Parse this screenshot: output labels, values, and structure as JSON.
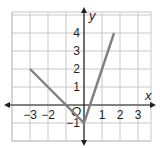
{
  "chart_data": {
    "type": "line",
    "title": "",
    "xlabel": "x",
    "ylabel": "y",
    "xlim": [
      -3.5,
      3.5
    ],
    "ylim": [
      -2,
      4.5
    ],
    "grid": true,
    "origin_label": "O",
    "x_ticks": [
      -3,
      -2,
      1,
      2,
      3
    ],
    "x_tick_labels": [
      "−3",
      "−2",
      "1",
      "2",
      "3"
    ],
    "y_ticks": [
      -1,
      1,
      2,
      3,
      4
    ],
    "y_tick_labels": [
      "−1",
      "1",
      "2",
      "3",
      "4"
    ],
    "series": [
      {
        "name": "absolute value graph",
        "color": "#808080",
        "points": [
          [
            -3,
            2
          ],
          [
            0,
            -1
          ],
          [
            1.67,
            4
          ]
        ]
      }
    ]
  }
}
